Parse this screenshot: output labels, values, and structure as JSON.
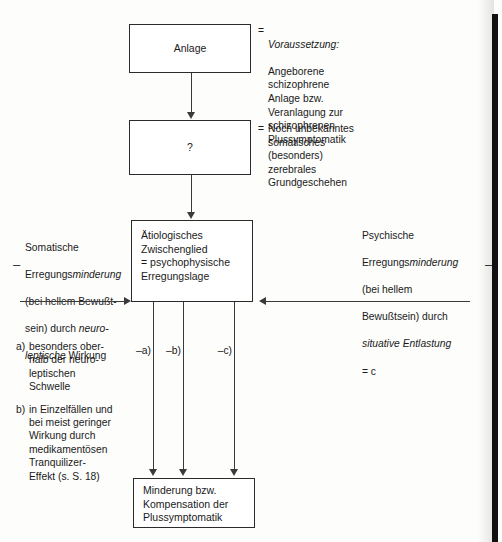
{
  "diagram": {
    "boxes": {
      "anlage": {
        "label": "Anlage"
      },
      "unknown": {
        "label": "?"
      },
      "central": {
        "label": "Ätiologisches\nZwischenglied\n= psychophysische\nErregungslage"
      },
      "outcome": {
        "label": "Minderung bzw.\nKompensation der\nPlussymptomatik"
      }
    },
    "annotations": {
      "anlage_note": {
        "equals": "=",
        "emphasis": "Voraussetzung:",
        "body": "Angeborene\nschizophrene\nAnlage bzw.\nVeranlagung zur\nschizophrenen\nPlussymptomatik"
      },
      "unknown_note": {
        "equals": "=",
        "body": "Noch unbekanntes\nsomatisches\n(besonders)\nzerebrales\nGrundgeschehen"
      },
      "left_note": {
        "sign": "–",
        "line1_plain": "Somatische",
        "line2_plain": "Erregungs",
        "line2_italic": "minderung",
        "line3_plain": "(bei hellem Bewußt-",
        "line4_plain": "sein) durch ",
        "line4_italic": "neuro-",
        "line5_italic": "leptische",
        "line5_plain": " Wirkung"
      },
      "right_note": {
        "sign": "–",
        "line1_plain": "Psychische",
        "line2_plain": "Erregungs",
        "line2_italic": "minderung",
        "line3_plain": "(bei hellem",
        "line4_plain": "Bewußtsein) durch",
        "line5_italic": "situative Entlastung",
        "line6_plain": "= c"
      }
    },
    "branch_labels": {
      "a": "–a)",
      "b": "–b)",
      "c": "–c)"
    },
    "footnotes": [
      {
        "marker": "a)",
        "text": "besonders ober-\nhalb der neuro-\nleptischen\nSchwelle"
      },
      {
        "marker": "b)",
        "text": "in Einzelfällen und\nbei meist geringer\nWirkung durch\nmedikamentösen\nTranquilizer-\nEffekt (s. S. 18)"
      }
    ],
    "colors": {
      "ink": "#1a1a1a",
      "stroke": "#2b2b2b",
      "page": "#fdfdfc",
      "scan_edge": "#111111"
    }
  }
}
